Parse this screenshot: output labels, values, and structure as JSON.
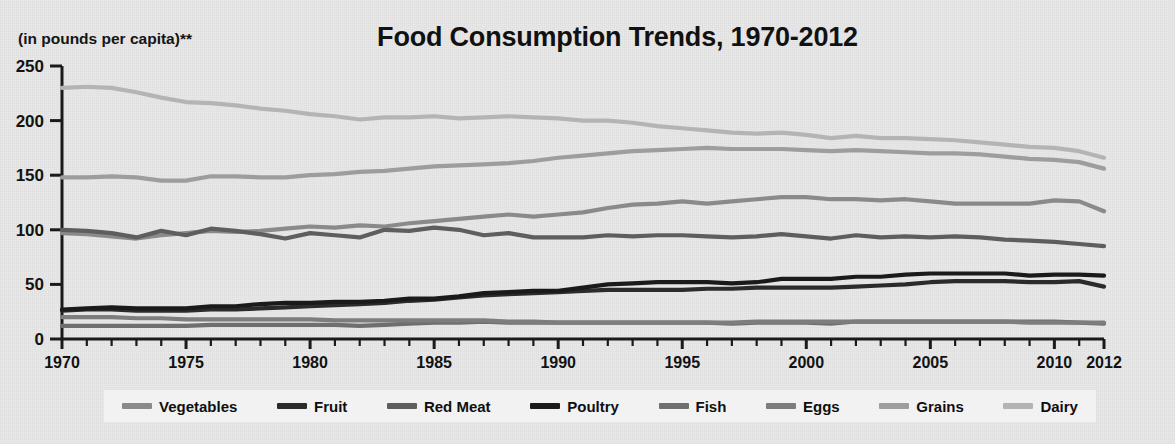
{
  "header": {
    "title": "Food Consumption Trends, 1970-2012",
    "axis_subtitle": "(in pounds per capita)**"
  },
  "chart_data": {
    "type": "line",
    "title": "Food Consumption Trends, 1970-2012",
    "subtitle": "(in pounds per capita)**",
    "xlabel": "",
    "ylabel": "(in pounds per capita)**",
    "xlim": [
      1970,
      2012
    ],
    "ylim": [
      0,
      250
    ],
    "yticks": [
      0,
      50,
      100,
      150,
      200,
      250
    ],
    "xticks": [
      1970,
      1975,
      1980,
      1985,
      1990,
      1995,
      2000,
      2005,
      2010,
      2012
    ],
    "xtick_labels": [
      "1970",
      "1975",
      "1980",
      "1985",
      "1990",
      "1995",
      "2000",
      "2005",
      "2010",
      "2012"
    ],
    "ytick_labels": [
      "0",
      "50",
      "100",
      "150",
      "200",
      "250"
    ],
    "grid": false,
    "legend_position": "bottom",
    "x": [
      1970,
      1971,
      1972,
      1973,
      1974,
      1975,
      1976,
      1977,
      1978,
      1979,
      1980,
      1981,
      1982,
      1983,
      1984,
      1985,
      1986,
      1987,
      1988,
      1989,
      1990,
      1991,
      1992,
      1993,
      1994,
      1995,
      1996,
      1997,
      1998,
      1999,
      2000,
      2001,
      2002,
      2003,
      2004,
      2005,
      2006,
      2007,
      2008,
      2009,
      2010,
      2011,
      2012
    ],
    "series": [
      {
        "name": "Vegetables",
        "color": "#8a8a8a",
        "values": [
          97,
          96,
          94,
          92,
          95,
          97,
          99,
          98,
          99,
          101,
          103,
          102,
          104,
          103,
          106,
          108,
          110,
          112,
          114,
          112,
          114,
          116,
          120,
          123,
          124,
          126,
          124,
          126,
          128,
          130,
          130,
          128,
          128,
          127,
          128,
          126,
          124,
          124,
          124,
          124,
          127,
          126,
          117
        ]
      },
      {
        "name": "Fruit",
        "color": "#2b2b2b",
        "values": [
          26,
          27,
          27,
          26,
          26,
          26,
          27,
          27,
          28,
          29,
          30,
          31,
          32,
          33,
          35,
          36,
          38,
          40,
          41,
          42,
          43,
          44,
          45,
          45,
          45,
          45,
          46,
          46,
          47,
          47,
          47,
          47,
          48,
          49,
          50,
          52,
          53,
          53,
          53,
          52,
          52,
          53,
          48
        ]
      },
      {
        "name": "Red Meat",
        "color": "#5e5e5e",
        "values": [
          100,
          99,
          97,
          93,
          99,
          95,
          101,
          99,
          96,
          92,
          97,
          95,
          93,
          100,
          99,
          102,
          100,
          95,
          97,
          93,
          93,
          93,
          95,
          94,
          95,
          95,
          94,
          93,
          94,
          96,
          94,
          92,
          95,
          93,
          94,
          93,
          94,
          93,
          91,
          90,
          89,
          87,
          85
        ]
      },
      {
        "name": "Poultry",
        "color": "#1a1a1a",
        "values": [
          27,
          28,
          29,
          28,
          28,
          28,
          30,
          30,
          32,
          33,
          33,
          34,
          34,
          35,
          37,
          37,
          39,
          42,
          43,
          44,
          44,
          47,
          50,
          51,
          52,
          52,
          52,
          51,
          52,
          55,
          55,
          55,
          57,
          57,
          59,
          60,
          60,
          60,
          60,
          58,
          59,
          59,
          58
        ]
      },
      {
        "name": "Fish",
        "color": "#6f6f6f",
        "values": [
          12,
          12,
          12,
          12,
          12,
          12,
          13,
          13,
          13,
          13,
          13,
          13,
          12,
          13,
          14,
          15,
          15,
          16,
          15,
          15,
          15,
          15,
          15,
          15,
          15,
          15,
          15,
          14,
          15,
          15,
          15,
          14,
          16,
          16,
          16,
          16,
          16,
          16,
          16,
          16,
          16,
          15,
          14
        ]
      },
      {
        "name": "Eggs",
        "color": "#7d7d7d",
        "values": [
          20,
          20,
          20,
          19,
          19,
          18,
          18,
          18,
          18,
          18,
          18,
          17,
          17,
          17,
          17,
          17,
          17,
          17,
          16,
          16,
          15,
          15,
          15,
          15,
          15,
          15,
          15,
          15,
          16,
          16,
          16,
          16,
          16,
          16,
          16,
          16,
          16,
          16,
          16,
          15,
          15,
          15,
          15
        ]
      },
      {
        "name": "Grains",
        "color": "#9d9d9d",
        "values": [
          148,
          148,
          149,
          148,
          145,
          145,
          149,
          149,
          148,
          148,
          150,
          151,
          153,
          154,
          156,
          158,
          159,
          160,
          161,
          163,
          166,
          168,
          170,
          172,
          173,
          174,
          175,
          174,
          174,
          174,
          173,
          172,
          173,
          172,
          171,
          170,
          170,
          169,
          167,
          165,
          164,
          162,
          156
        ]
      },
      {
        "name": "Dairy",
        "color": "#b4b4b4",
        "values": [
          230,
          231,
          230,
          226,
          221,
          217,
          216,
          214,
          211,
          209,
          206,
          204,
          201,
          203,
          203,
          204,
          202,
          203,
          204,
          203,
          202,
          200,
          200,
          198,
          195,
          193,
          191,
          189,
          188,
          189,
          187,
          184,
          186,
          184,
          184,
          183,
          182,
          180,
          178,
          176,
          175,
          172,
          166
        ]
      }
    ]
  },
  "legend": {
    "items": [
      {
        "label": "Vegetables",
        "color": "#8a8a8a"
      },
      {
        "label": "Fruit",
        "color": "#2b2b2b"
      },
      {
        "label": "Red Meat",
        "color": "#5e5e5e"
      },
      {
        "label": "Poultry",
        "color": "#1a1a1a"
      },
      {
        "label": "Fish",
        "color": "#6f6f6f"
      },
      {
        "label": "Eggs",
        "color": "#7d7d7d"
      },
      {
        "label": "Grains",
        "color": "#9d9d9d"
      },
      {
        "label": "Dairy",
        "color": "#b4b4b4"
      }
    ]
  },
  "colors": {
    "background": "#e9e9e9",
    "legend_background": "#f2f2f2",
    "axis": "#1a1a1a",
    "text": "#111111"
  }
}
